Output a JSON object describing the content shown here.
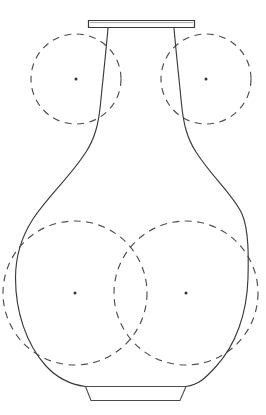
{
  "figure": {
    "canvas": {
      "width": 266,
      "height": 415,
      "background": "#ffffff"
    },
    "style": {
      "outline_color": "#3a3a3c",
      "construction_color": "#4d4d4f",
      "center_dot_color": "#333335",
      "outline_width": 1.15,
      "construction_width": 1.15,
      "construction_dash": "7 5.5"
    }
  },
  "parts": {
    "rim": {
      "name": "rim",
      "label": "Rim (mouth lip)",
      "x": 88,
      "y": 20,
      "width": 107,
      "height": 8,
      "path": "M 88.5 20.5 L 194.5 20.5 L 194.5 27.5 L 88.5 27.5 Z",
      "inner_path": "M 90 22.6 L 193 22.6"
    },
    "foot": {
      "name": "foot",
      "label": "Foot (base ring)",
      "path": "M 85.5 386.5 L 186.0 386.5 L 180.0 400.5 L 91.0 400.5 Z",
      "top_left_x": 85,
      "top_right_x": 186,
      "bottom_left_x": 91,
      "bottom_right_x": 180,
      "top_y": 386,
      "bottom_y": 401
    },
    "body": {
      "name": "vase-body-silhouette",
      "label": "Vase body profile",
      "left_path": "M 108.0 28.0 C 106.0 52.0 103.0 78.0 100.5 104.0 C 98.5 124.0 95.0 138.0 86.0 152.0 C 70.0 177.0 48.0 196.0 33.0 219.0 C 21.0 237.5 15.5 258.0 15.5 278.0 C 15.5 311.0 26.0 344.0 46.0 366.0 C 57.0 378.0 70.0 384.5 85.5 386.5",
      "right_path": "M 174.0 28.0 C 176.0 52.0 179.0 78.0 181.5 104.0 C 183.5 124.0 187.0 138.0 196.0 152.0 C 212.0 177.0 234.0 196.0 242.0 214.0 C 249.0 230.0 248.5 258.0 248.0 278.0 C 247.0 313.0 236.0 345.0 216.0 366.5 C 205.0 378.5 199.0 384.5 186.0 386.5",
      "neck_top_left_x": 108,
      "neck_top_right_x": 174,
      "widest_left_x": 15,
      "widest_right_x": 248
    }
  },
  "construction_circles": [
    {
      "name": "upper-left-circle",
      "label": "Upper left construction circle",
      "cx": 76,
      "cy": 79,
      "r": 45,
      "position": "upper-left"
    },
    {
      "name": "upper-right-circle",
      "label": "Upper right construction circle",
      "cx": 206,
      "cy": 79,
      "r": 45,
      "position": "upper-right"
    },
    {
      "name": "lower-left-circle",
      "label": "Lower left construction circle",
      "cx": 75,
      "cy": 293,
      "r": 72,
      "position": "lower-left"
    },
    {
      "name": "lower-right-circle",
      "label": "Lower right construction circle",
      "cx": 186,
      "cy": 293,
      "r": 72,
      "position": "lower-right"
    }
  ],
  "center_dots": [
    {
      "name": "upper-left-center-dot",
      "cx": 76,
      "cy": 79,
      "r": 1.5
    },
    {
      "name": "upper-right-center-dot",
      "cx": 206,
      "cy": 79,
      "r": 1.5
    },
    {
      "name": "lower-left-center-dot",
      "cx": 75,
      "cy": 293,
      "r": 1.5
    },
    {
      "name": "lower-right-center-dot",
      "cx": 186,
      "cy": 293,
      "r": 1.5
    }
  ]
}
